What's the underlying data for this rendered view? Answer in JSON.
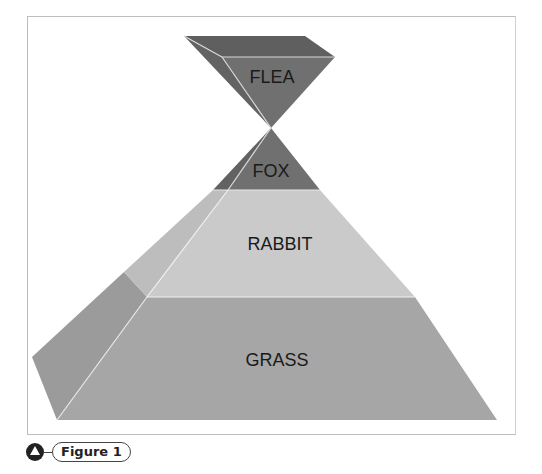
{
  "diagram": {
    "type": "inverted-pyramid-of-numbers",
    "levels": [
      {
        "label": "FLEA",
        "color": "#6f6f6f",
        "side_color": "#606060"
      },
      {
        "label": "FOX",
        "color": "#6f6f6f",
        "side_color": "#606060"
      },
      {
        "label": "RABBIT",
        "color": "#c8c8c8",
        "side_color": "#bdbdbd"
      },
      {
        "label": "GRASS",
        "color": "#a3a3a3",
        "side_color": "#999999"
      }
    ]
  },
  "caption": {
    "label": "Figure 1",
    "icon": "triangle-in-circle-icon"
  }
}
